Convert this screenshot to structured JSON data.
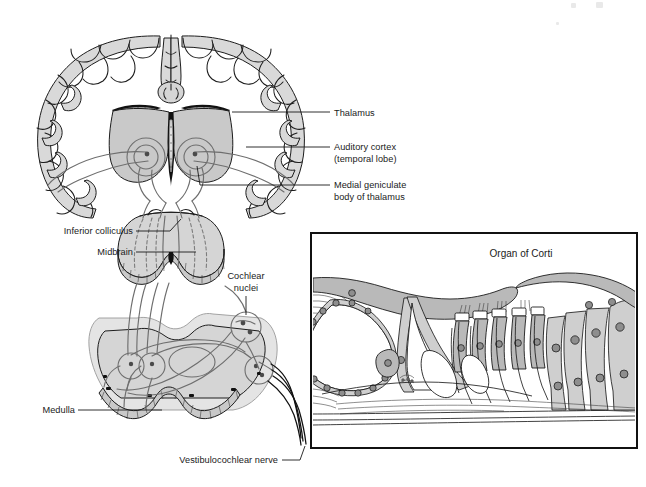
{
  "figure": {
    "type": "anatomical-illustration",
    "background_color": "#ffffff",
    "line_color": "#1a1a1a",
    "tissue_fill": "#d9d9d9",
    "pathway_color": "#6e6e6e"
  },
  "labels": [
    {
      "id": "thalamus",
      "text": "Thalamus",
      "text2": "",
      "x": 332,
      "y": 115,
      "align": "start"
    },
    {
      "id": "auditory-cortex",
      "text": "Auditory cortex",
      "text2": "(temporal lobe)",
      "x": 332,
      "y": 150,
      "align": "start"
    },
    {
      "id": "mgb",
      "text": "Medial geniculate",
      "text2": "body of thalamus",
      "x": 332,
      "y": 188,
      "align": "start"
    },
    {
      "id": "inferior-colliculus",
      "text": "Inferior colliculus",
      "text2": "",
      "x": 133,
      "y": 234,
      "align": "end"
    },
    {
      "id": "midbrain",
      "text": "Midbrain",
      "text2": "",
      "x": 133,
      "y": 255,
      "align": "end"
    },
    {
      "id": "cochlear-nuclei",
      "text": "Cochlear",
      "text2": "nuclei",
      "x": 264,
      "y": 285,
      "align": "middle"
    },
    {
      "id": "medulla",
      "text": "Medulla",
      "text2": "",
      "x": 75,
      "y": 413,
      "align": "end"
    },
    {
      "id": "vestibulocochlear-nerve",
      "text": "Vestibulocochlear nerve",
      "text2": "",
      "x": 278,
      "y": 463,
      "align": "end"
    }
  ],
  "inset": {
    "title": "Organ of Corti",
    "title_x": 521,
    "title_y": 255,
    "frame": {
      "x": 311,
      "y": 233,
      "width": 326,
      "height": 215
    },
    "border_color": "#111111",
    "background": "#ffffff"
  },
  "structures": [
    {
      "name": "cerebrum-coronal-section"
    },
    {
      "name": "thalamus-gray-mass"
    },
    {
      "name": "medial-geniculate-body"
    },
    {
      "name": "midbrain-section"
    },
    {
      "name": "inferior-colliculus"
    },
    {
      "name": "medulla-section"
    },
    {
      "name": "cochlear-nuclei"
    },
    {
      "name": "vestibulocochlear-nerve-fibers"
    },
    {
      "name": "organ-of-corti-inset"
    }
  ]
}
